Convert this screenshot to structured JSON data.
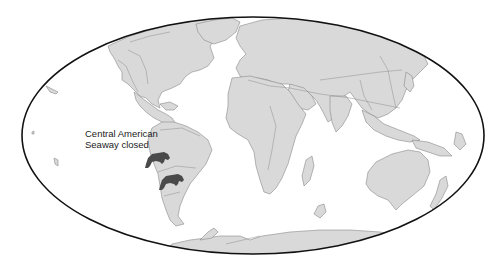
{
  "map": {
    "projection": "Mollweide",
    "frame": {
      "cx": 253,
      "cy": 135.5,
      "rx": 231,
      "ry": 118.5
    },
    "colors": {
      "background": "#ffffff",
      "ocean": "#ffffff",
      "land": "#d9d9d9",
      "coastline": "#8a8a8a",
      "frame": "#111111",
      "marker": "#4a4a4a",
      "label": "#222222"
    }
  },
  "annotation": {
    "line1": "Central American",
    "line2": "Seaway closed"
  },
  "markers": [
    {
      "icon": "bear-icon",
      "x": 153,
      "y": 160
    },
    {
      "icon": "bear-icon",
      "x": 168,
      "y": 183
    }
  ]
}
